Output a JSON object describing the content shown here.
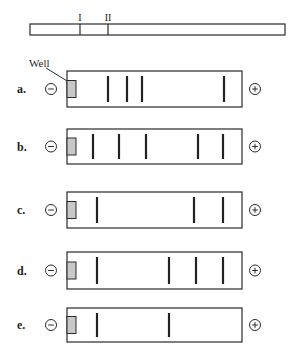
{
  "colors": {
    "stroke": "#2a2a2a",
    "band": "#222222",
    "well_fill": "#c8c8c8",
    "background": "#ffffff"
  },
  "restriction_map": {
    "x_start": 30,
    "x_end": 285,
    "y_top": 24,
    "y_bottom": 35,
    "sites": [
      {
        "label": "I",
        "x": 80
      },
      {
        "label": "II",
        "x": 108
      }
    ]
  },
  "well_label": {
    "text": "Well",
    "x": 29,
    "y": 67,
    "leader": {
      "x1": 46,
      "y1": 68,
      "x2": 72,
      "y2": 84
    }
  },
  "gel": {
    "x_left": 67,
    "x_right": 242,
    "well": {
      "dx": 0,
      "width": 9,
      "height": 17
    },
    "minus_cx": 51,
    "plus_cx": 255,
    "electrode_r": 5.5,
    "minus_symbol": "−",
    "plus_symbol": "+"
  },
  "lanes": [
    {
      "label": "a.",
      "y_top": 71,
      "y_bottom": 107,
      "bands_x": [
        108,
        127,
        142,
        224
      ]
    },
    {
      "label": "b.",
      "y_top": 129,
      "y_bottom": 164,
      "bands_x": [
        93,
        119,
        146,
        198,
        223
      ]
    },
    {
      "label": "c.",
      "y_top": 192,
      "y_bottom": 228,
      "bands_x": [
        97,
        194,
        223
      ]
    },
    {
      "label": "d.",
      "y_top": 252,
      "y_bottom": 289,
      "bands_x": [
        97,
        169,
        196,
        223
      ]
    },
    {
      "label": "e.",
      "y_top": 308,
      "y_bottom": 342,
      "bands_x": [
        97,
        169
      ]
    }
  ]
}
